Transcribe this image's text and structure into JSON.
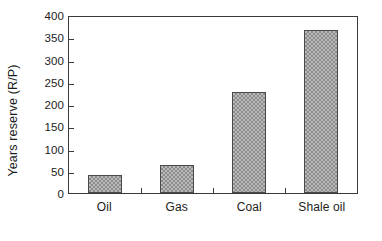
{
  "chart_data": {
    "type": "bar",
    "title": "",
    "subtitle": "",
    "xlabel": "",
    "ylabel": "Years reserve (R/P)",
    "categories": [
      "Oil",
      "Gas",
      "Coal",
      "Shale oil"
    ],
    "values": [
      41,
      64,
      230,
      370
    ],
    "ylim": [
      0,
      400
    ],
    "ytick_step": 50,
    "ytick_labels": [
      "0",
      "50",
      "100",
      "150",
      "200",
      "250",
      "300",
      "350",
      "400"
    ],
    "ytick_values": [
      0,
      50,
      100,
      150,
      200,
      250,
      300,
      350,
      400
    ],
    "grid": false,
    "legend": null,
    "legend_position": "none",
    "annotations": [],
    "bar_fill": "#b9b9b9",
    "bar_pattern": "checkered-halftone-gray",
    "bar_border_color": "#4a4a4a",
    "axis_color": "#3a3a3a",
    "background_color": "#ffffff",
    "text_color": "#1c1c1c",
    "tick_direction": "in",
    "xtick_placement": "category-boundaries"
  }
}
